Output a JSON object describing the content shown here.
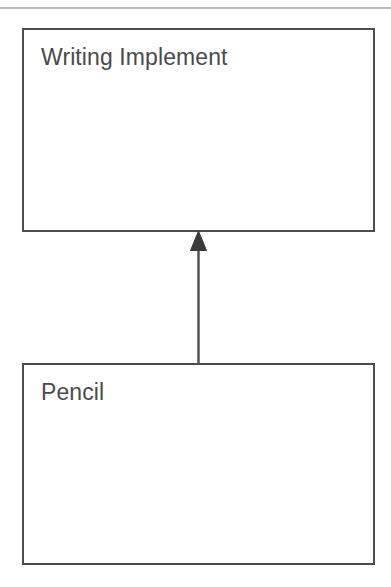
{
  "diagram": {
    "type": "uml-class-diagram",
    "notation": "UML generalization (inheritance)",
    "background_color": "#ffffff",
    "line_color": "#4d4d4d",
    "text_color": "#4a4a4a",
    "page_rule": {
      "name": "page-top-rule",
      "color": "#a8a8a8"
    },
    "classes": [
      {
        "id": "writing-implement",
        "name": "Writing Implement",
        "role": "superclass",
        "x": 22,
        "y": 28,
        "width": 353,
        "height": 204
      },
      {
        "id": "pencil",
        "name": "Pencil",
        "role": "subclass",
        "x": 22,
        "y": 363,
        "width": 353,
        "height": 202
      }
    ],
    "relationships": [
      {
        "id": "pencil-is-a-writing-implement",
        "kind": "generalization",
        "label": "",
        "from": "Pencil",
        "to": "Writing Implement",
        "arrowhead": "solid-triangle",
        "line_style": "solid"
      }
    ]
  }
}
